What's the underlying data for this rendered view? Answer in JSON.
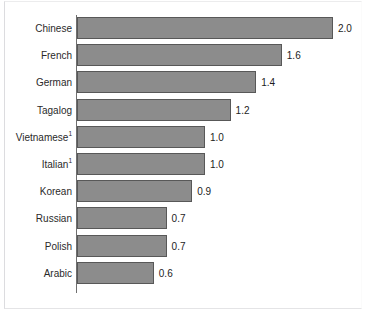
{
  "chart_data": {
    "type": "bar",
    "orientation": "horizontal",
    "title": "",
    "xlabel": "",
    "ylabel": "",
    "grid": false,
    "legend": null,
    "xlim": [
      0,
      2.0
    ],
    "categories": [
      "Chinese",
      "French",
      "German",
      "Tagalog",
      "Vietnamese",
      "Italian",
      "Korean",
      "Russian",
      "Polish",
      "Arabic"
    ],
    "values": [
      2.0,
      1.6,
      1.4,
      1.2,
      1.0,
      1.0,
      0.9,
      0.7,
      0.7,
      0.6
    ],
    "value_labels": [
      "2.0",
      "1.6",
      "1.4",
      "1.2",
      "1.0",
      "1.0",
      "0.9",
      "0.7",
      "0.7",
      "0.6"
    ],
    "category_footnotes": [
      "",
      "",
      "",
      "",
      "1",
      "1",
      "",
      "",
      "",
      ""
    ],
    "bar_color": "#8c8c8c",
    "bar_border_color": "#585858",
    "axis_color": "#6f6f6f"
  }
}
